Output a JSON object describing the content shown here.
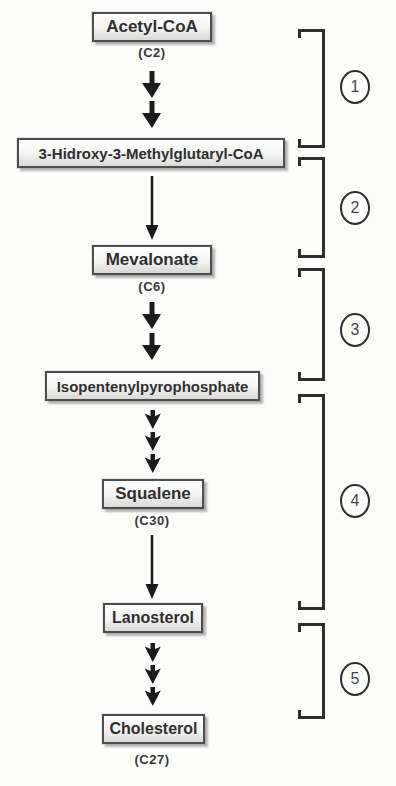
{
  "diagram": {
    "ink_color": "#2e2e2e",
    "arrow_color": "#1b1b1b",
    "box_border_color": "#4d4d4d",
    "nodes": [
      {
        "label": "Acetyl-CoA",
        "sublabel": "(C2)"
      },
      {
        "label": "3-Hidroxy-3-Methylglutaryl-CoA"
      },
      {
        "label": "Mevalonate",
        "sublabel": "(C6)"
      },
      {
        "label": "Isopentenylpyrophosphate"
      },
      {
        "label": "Squalene",
        "sublabel": "(C30)"
      },
      {
        "label": "Lanosterol"
      },
      {
        "label": "Cholesterol",
        "sublabel": "(C27)"
      }
    ],
    "steps": [
      {
        "number": "1"
      },
      {
        "number": "2"
      },
      {
        "number": "3"
      },
      {
        "number": "4"
      },
      {
        "number": "5"
      }
    ]
  }
}
